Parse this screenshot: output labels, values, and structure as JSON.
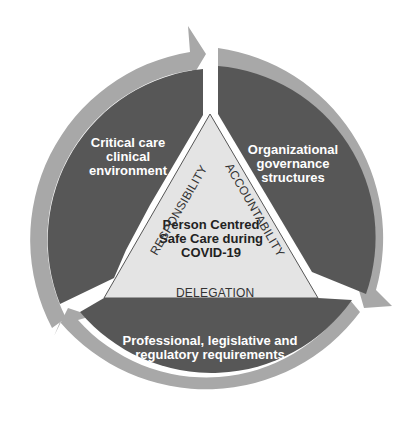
{
  "colors": {
    "background": "#ffffff",
    "segment_fill": "#575757",
    "arrow_ring": "#a8a8a8",
    "triangle_fill": "#e4e4e4",
    "triangle_stroke": "#555555"
  },
  "segments": [
    {
      "id": "top-left",
      "label_lines": [
        "Critical care",
        "clinical",
        "environment"
      ]
    },
    {
      "id": "top-right",
      "label_lines": [
        "Organizational",
        "governance",
        "structures"
      ]
    },
    {
      "id": "bottom",
      "label_lines": [
        "Professional, legislative and",
        "regulatory requirements"
      ]
    }
  ],
  "center": {
    "label_lines": [
      "Person Centred",
      "Safe Care during",
      "COVID-19"
    ]
  },
  "edges": {
    "left": "RESPONSIBILITY",
    "right": "ACCOUNTABILITY",
    "bottom": "DELEGATION"
  }
}
